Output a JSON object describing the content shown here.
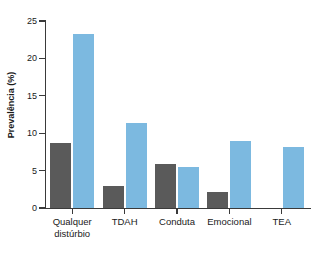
{
  "chart_data": {
    "type": "bar",
    "title": "",
    "xlabel": "",
    "ylabel": "Prevalência (%)",
    "ylim": [
      0,
      25
    ],
    "yticks": [
      0,
      5,
      10,
      15,
      20,
      25
    ],
    "ytick_labels": [
      "0",
      "5",
      "10",
      "15",
      "20",
      "25"
    ],
    "grid": false,
    "legend": "none",
    "categories": [
      "Qualquer distúrbio",
      "TDAH",
      "Conduta",
      "Emocional",
      "TEA"
    ],
    "category_lines": [
      [
        "Qualquer",
        "distúrbio"
      ],
      [
        "TDAH",
        ""
      ],
      [
        "Conduta",
        ""
      ],
      [
        "Emocional",
        ""
      ],
      [
        "TEA",
        ""
      ]
    ],
    "series": [
      {
        "name": "gray",
        "color": "#5a5a5a",
        "values": [
          8.7,
          2.9,
          5.9,
          2.2,
          null
        ]
      },
      {
        "name": "blue",
        "color": "#7cb9e0",
        "values": [
          23.3,
          11.4,
          5.5,
          9.0,
          8.1
        ]
      }
    ]
  },
  "colors": {
    "gray_bar": "#5a5a5a",
    "blue_bar": "#7cb9e0",
    "axis": "#3a3a3a",
    "text": "#1a1a1a",
    "background": "#ffffff"
  }
}
